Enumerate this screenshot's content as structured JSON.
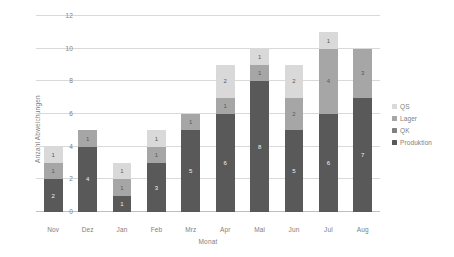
{
  "chart_data": {
    "type": "bar",
    "subtype": "stacked-column",
    "title": "",
    "xlabel": "Monat",
    "ylabel": "Anzahl Abweichungen",
    "ylim": [
      0,
      12
    ],
    "yticks": [
      0,
      2,
      4,
      6,
      8,
      10,
      12
    ],
    "grid": true,
    "legend_position": "right",
    "categories": [
      "Nov",
      "Dez",
      "Jan",
      "Feb",
      "Mrz",
      "Apr",
      "Mai",
      "Jun",
      "Jul",
      "Aug"
    ],
    "series": [
      {
        "name": "Produktion",
        "color": "#595959",
        "values": [
          2,
          4,
          1,
          3,
          5,
          6,
          8,
          5,
          6,
          7
        ]
      },
      {
        "name": "QK",
        "color": "#808080",
        "values": [
          0,
          0,
          0,
          0,
          0,
          0,
          0,
          0,
          0,
          0
        ]
      },
      {
        "name": "Lager",
        "color": "#a6a6a6",
        "values": [
          1,
          1,
          1,
          1,
          1,
          1,
          1,
          2,
          4,
          3
        ]
      },
      {
        "name": "QS",
        "color": "#d9d9d9",
        "values": [
          1,
          0,
          1,
          1,
          0,
          2,
          1,
          2,
          1,
          0
        ]
      }
    ],
    "totals": [
      4,
      5,
      3,
      5,
      6,
      9,
      10,
      9,
      11,
      10
    ],
    "data_labels": {
      "Nov": {
        "Produktion": "2",
        "Lager": "1",
        "QS": "1"
      },
      "Dez": {
        "Produktion": "4",
        "Lager": "1",
        "QS": ""
      },
      "Jan": {
        "Produktion": "1",
        "Lager": "1",
        "QS": "1"
      },
      "Feb": {
        "Produktion": "3",
        "Lager": "1",
        "QS": "1"
      },
      "Mrz": {
        "Produktion": "5",
        "Lager": "1",
        "QS": ""
      },
      "Apr": {
        "Produktion": "6",
        "Lager": "1",
        "QS": "2"
      },
      "Mai": {
        "Produktion": "8",
        "Lager": "1",
        "QS": "1"
      },
      "Jun": {
        "Produktion": "5",
        "Lager": "2",
        "QS": "2"
      },
      "Jul": {
        "Produktion": "6",
        "Lager": "4",
        "QS": "1"
      },
      "Aug": {
        "Produktion": "7",
        "Lager": "3",
        "QS": ""
      }
    },
    "legend": [
      {
        "label": "QS",
        "color": "#d9d9d9"
      },
      {
        "label": "Lager",
        "color": "#a6a6a6"
      },
      {
        "label": "QK",
        "color": "#808080"
      },
      {
        "label": "Produktion",
        "color": "#595959"
      }
    ],
    "colors": {
      "gridline": "#d9d9d9",
      "axis": "#bfbfbf",
      "tick_text": "#808080",
      "plot_background": "#ffffff"
    }
  }
}
